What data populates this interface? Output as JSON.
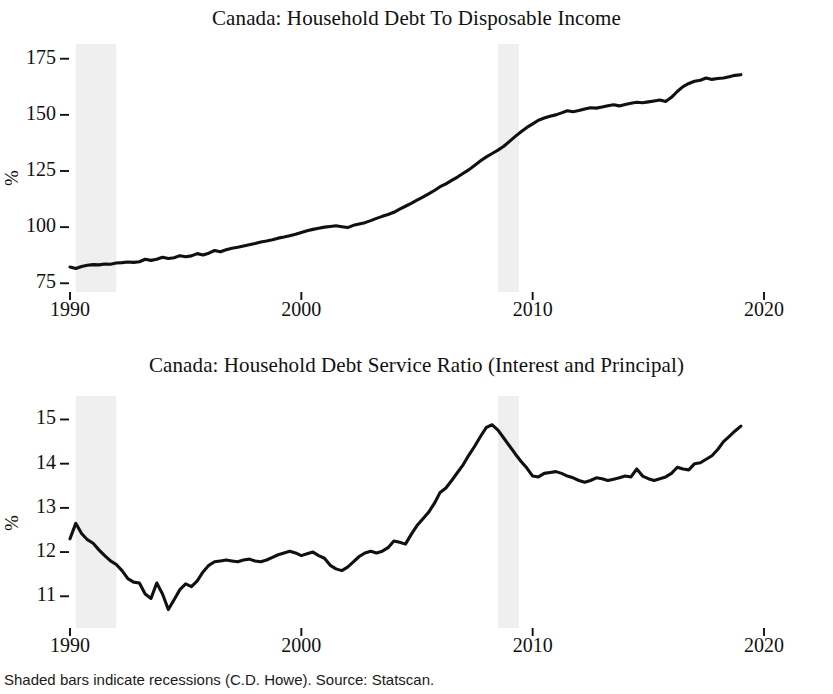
{
  "figure": {
    "footnote": "Shaded bars indicate recessions (C.D. Howe). Source: Statscan.",
    "background_color": "#ffffff",
    "line_color": "#101010",
    "recession_band_color": "#ececec"
  },
  "panels": {
    "top": {
      "title": "Canada: Household Debt To Disposable Income",
      "ylabel": "%",
      "ytick_labels": [
        "75",
        "100",
        "125",
        "150",
        "175"
      ],
      "xtick_labels": [
        "1990",
        "2000",
        "2010",
        "2020"
      ]
    },
    "bottom": {
      "title": "Canada: Household Debt Service Ratio (Interest and Principal)",
      "ylabel": "%",
      "ytick_labels": [
        "11",
        "12",
        "13",
        "14",
        "15"
      ],
      "xtick_labels": [
        "1990",
        "2000",
        "2010",
        "2020"
      ]
    }
  },
  "chart_data": [
    {
      "type": "line",
      "title": "Canada: Household Debt To Disposable Income",
      "xlabel": "",
      "ylabel": "%",
      "xlim": [
        1990.0,
        2020.0
      ],
      "ylim": [
        72.0,
        178.0
      ],
      "yticks": [
        75,
        100,
        125,
        150,
        175
      ],
      "xticks": [
        1990,
        2000,
        2010,
        2020
      ],
      "grid": false,
      "legend": null,
      "recessions": [
        [
          1990.25,
          1992.0
        ],
        [
          2008.5,
          2009.4
        ]
      ],
      "series": [
        {
          "name": "Household debt to disposable income",
          "x": [
            1990.0,
            1990.25,
            1990.5,
            1990.75,
            1991.0,
            1991.25,
            1991.5,
            1991.75,
            1992.0,
            1992.25,
            1992.5,
            1992.75,
            1993.0,
            1993.25,
            1993.5,
            1993.75,
            1994.0,
            1994.25,
            1994.5,
            1994.75,
            1995.0,
            1995.25,
            1995.5,
            1995.75,
            1996.0,
            1996.25,
            1996.5,
            1996.75,
            1997.0,
            1997.25,
            1997.5,
            1997.75,
            1998.0,
            1998.25,
            1998.5,
            1998.75,
            1999.0,
            1999.25,
            1999.5,
            1999.75,
            2000.0,
            2000.25,
            2000.5,
            2000.75,
            2001.0,
            2001.25,
            2001.5,
            2001.75,
            2002.0,
            2002.25,
            2002.5,
            2002.75,
            2003.0,
            2003.25,
            2003.5,
            2003.75,
            2004.0,
            2004.25,
            2004.5,
            2004.75,
            2005.0,
            2005.25,
            2005.5,
            2005.75,
            2006.0,
            2006.25,
            2006.5,
            2006.75,
            2007.0,
            2007.25,
            2007.5,
            2007.75,
            2008.0,
            2008.25,
            2008.5,
            2008.75,
            2009.0,
            2009.25,
            2009.5,
            2009.75,
            2010.0,
            2010.25,
            2010.5,
            2010.75,
            2011.0,
            2011.25,
            2011.5,
            2011.75,
            2012.0,
            2012.25,
            2012.5,
            2012.75,
            2013.0,
            2013.25,
            2013.5,
            2013.75,
            2014.0,
            2014.25,
            2014.5,
            2014.75,
            2015.0,
            2015.25,
            2015.5,
            2015.75,
            2016.0,
            2016.25,
            2016.5,
            2016.75,
            2017.0,
            2017.25,
            2017.5,
            2017.75,
            2018.0,
            2018.25,
            2018.5,
            2018.75,
            2019.0
          ],
          "y": [
            82.2,
            81.6,
            82.5,
            83.0,
            83.3,
            83.2,
            83.6,
            83.5,
            84.0,
            84.2,
            84.5,
            84.3,
            84.6,
            85.7,
            85.2,
            85.7,
            86.6,
            86.0,
            86.4,
            87.3,
            86.8,
            87.2,
            88.2,
            87.6,
            88.4,
            89.6,
            89.0,
            89.9,
            90.6,
            91.0,
            91.6,
            92.2,
            92.7,
            93.4,
            93.8,
            94.4,
            95.1,
            95.6,
            96.2,
            96.8,
            97.6,
            98.4,
            99.0,
            99.5,
            100.0,
            100.3,
            100.6,
            100.2,
            99.8,
            100.8,
            101.4,
            102.0,
            102.9,
            103.9,
            104.8,
            105.6,
            106.6,
            108.0,
            109.3,
            110.6,
            112.0,
            113.4,
            114.8,
            116.3,
            118.0,
            119.3,
            120.8,
            122.3,
            124.0,
            125.6,
            127.6,
            129.6,
            131.3,
            132.8,
            134.3,
            136.0,
            138.2,
            140.4,
            142.5,
            144.4,
            146.0,
            147.6,
            148.6,
            149.4,
            150.0,
            150.9,
            151.8,
            151.4,
            151.9,
            152.6,
            153.2,
            153.0,
            153.5,
            154.1,
            154.5,
            154.0,
            154.6,
            155.2,
            155.6,
            155.4,
            155.8,
            156.2,
            156.6,
            156.0,
            157.8,
            160.4,
            162.6,
            164.0,
            165.0,
            165.4,
            166.4,
            165.8,
            166.2,
            166.4,
            167.0,
            167.6,
            167.9
          ]
        }
      ]
    },
    {
      "type": "line",
      "title": "Canada: Household Debt Service Ratio (Interest and Principal)",
      "xlabel": "",
      "ylabel": "%",
      "xlim": [
        1990.0,
        2020.0
      ],
      "ylim": [
        10.35,
        15.35
      ],
      "yticks": [
        11,
        12,
        13,
        14,
        15
      ],
      "xticks": [
        1990,
        2000,
        2010,
        2020
      ],
      "grid": false,
      "legend": null,
      "recessions": [
        [
          1990.25,
          1992.0
        ],
        [
          2008.5,
          2009.4
        ]
      ],
      "series": [
        {
          "name": "Household debt service ratio (interest and principal)",
          "x": [
            1990.0,
            1990.25,
            1990.5,
            1990.75,
            1991.0,
            1991.25,
            1991.5,
            1991.75,
            1992.0,
            1992.25,
            1992.5,
            1992.75,
            1993.0,
            1993.25,
            1993.5,
            1993.75,
            1994.0,
            1994.25,
            1994.5,
            1994.75,
            1995.0,
            1995.25,
            1995.5,
            1995.75,
            1996.0,
            1996.25,
            1996.5,
            1996.75,
            1997.0,
            1997.25,
            1997.5,
            1997.75,
            1998.0,
            1998.25,
            1998.5,
            1998.75,
            1999.0,
            1999.25,
            1999.5,
            1999.75,
            2000.0,
            2000.25,
            2000.5,
            2000.75,
            2001.0,
            2001.25,
            2001.5,
            2001.75,
            2002.0,
            2002.25,
            2002.5,
            2002.75,
            2003.0,
            2003.25,
            2003.5,
            2003.75,
            2004.0,
            2004.25,
            2004.5,
            2004.75,
            2005.0,
            2005.25,
            2005.5,
            2005.75,
            2006.0,
            2006.25,
            2006.5,
            2006.75,
            2007.0,
            2007.25,
            2007.5,
            2007.75,
            2008.0,
            2008.25,
            2008.5,
            2008.75,
            2009.0,
            2009.25,
            2009.5,
            2009.75,
            2010.0,
            2010.25,
            2010.5,
            2010.75,
            2011.0,
            2011.25,
            2011.5,
            2011.75,
            2012.0,
            2012.25,
            2012.5,
            2012.75,
            2013.0,
            2013.25,
            2013.5,
            2013.75,
            2014.0,
            2014.25,
            2014.5,
            2014.75,
            2015.0,
            2015.25,
            2015.5,
            2015.75,
            2016.0,
            2016.25,
            2016.5,
            2016.75,
            2017.0,
            2017.25,
            2017.5,
            2017.75,
            2018.0,
            2018.25,
            2018.5,
            2018.75,
            2019.0
          ],
          "y": [
            12.3,
            12.65,
            12.42,
            12.28,
            12.2,
            12.05,
            11.92,
            11.8,
            11.72,
            11.58,
            11.4,
            11.32,
            11.3,
            11.05,
            10.95,
            11.3,
            11.05,
            10.7,
            10.92,
            11.15,
            11.28,
            11.22,
            11.35,
            11.55,
            11.7,
            11.78,
            11.8,
            11.82,
            11.8,
            11.78,
            11.82,
            11.84,
            11.8,
            11.78,
            11.82,
            11.88,
            11.94,
            11.98,
            12.02,
            11.98,
            11.92,
            11.96,
            12.0,
            11.92,
            11.86,
            11.7,
            11.62,
            11.58,
            11.66,
            11.78,
            11.9,
            11.98,
            12.02,
            11.98,
            12.02,
            12.1,
            12.25,
            12.22,
            12.18,
            12.4,
            12.6,
            12.75,
            12.9,
            13.1,
            13.35,
            13.45,
            13.62,
            13.8,
            13.98,
            14.2,
            14.4,
            14.62,
            14.82,
            14.88,
            14.76,
            14.58,
            14.4,
            14.22,
            14.05,
            13.9,
            13.72,
            13.7,
            13.78,
            13.8,
            13.82,
            13.78,
            13.72,
            13.68,
            13.62,
            13.58,
            13.62,
            13.68,
            13.66,
            13.62,
            13.65,
            13.68,
            13.72,
            13.7,
            13.88,
            13.72,
            13.66,
            13.62,
            13.66,
            13.7,
            13.78,
            13.92,
            13.88,
            13.86,
            14.0,
            14.02,
            14.1,
            14.18,
            14.32,
            14.5,
            14.62,
            14.74,
            14.85
          ]
        }
      ]
    }
  ]
}
